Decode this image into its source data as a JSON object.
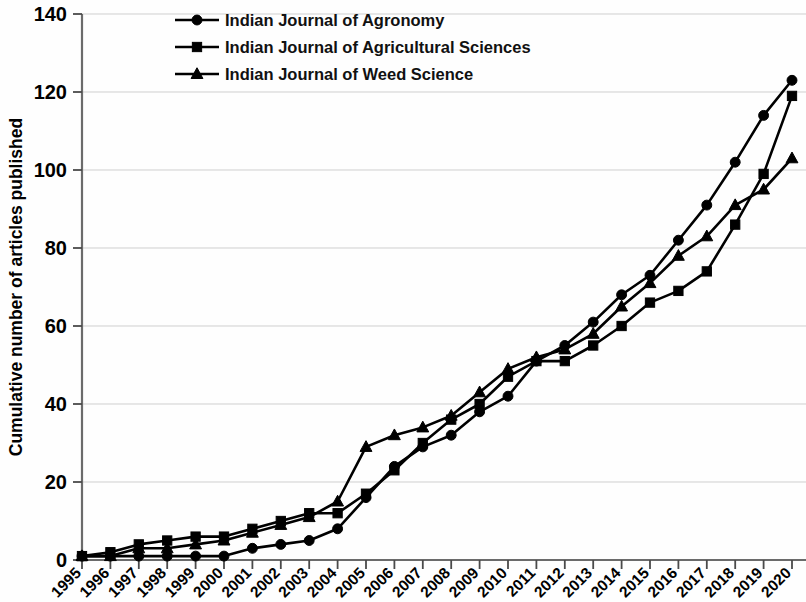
{
  "chart_data": {
    "type": "line",
    "title": "",
    "xlabel": "",
    "ylabel": "Cumulative number of articles published",
    "ylim": [
      0,
      140
    ],
    "yticks": [
      0,
      20,
      40,
      60,
      80,
      100,
      120,
      140
    ],
    "grid": true,
    "legend_position": "top-left",
    "categories": [
      "1995",
      "1996",
      "1997",
      "1998",
      "1999",
      "2000",
      "2001",
      "2002",
      "2003",
      "2004",
      "2005",
      "2006",
      "2007",
      "2008",
      "2009",
      "2010",
      "2011",
      "2012",
      "2013",
      "2014",
      "2015",
      "2016",
      "2017",
      "2018",
      "2019",
      "2020"
    ],
    "series": [
      {
        "name": "Indian Journal of Agronomy",
        "marker": "circle",
        "values": [
          1,
          1,
          1,
          1,
          1,
          1,
          3,
          4,
          5,
          8,
          16,
          24,
          29,
          32,
          38,
          42,
          51,
          55,
          61,
          68,
          73,
          82,
          91,
          102,
          114,
          123
        ]
      },
      {
        "name": "Indian Journal of Agricultural Sciences",
        "marker": "square",
        "values": [
          1,
          2,
          4,
          5,
          6,
          6,
          8,
          10,
          12,
          12,
          17,
          23,
          30,
          36,
          40,
          47,
          51,
          51,
          55,
          60,
          66,
          69,
          74,
          86,
          99,
          119
        ]
      },
      {
        "name": "Indian Journal of Weed Science",
        "marker": "triangle",
        "values": [
          1,
          1,
          3,
          3,
          4,
          5,
          7,
          9,
          11,
          15,
          29,
          32,
          34,
          37,
          43,
          49,
          52,
          54,
          58,
          65,
          71,
          78,
          83,
          91,
          95,
          103
        ]
      }
    ],
    "colors": {
      "line": "#000000",
      "grid": "#cfcfcf",
      "axis": "#6b6b6b",
      "background": "#fefefe"
    }
  },
  "axes": {
    "y_axis_title": "Cumulative number of articles published",
    "y_tick_labels": [
      "0",
      "20",
      "40",
      "60",
      "80",
      "100",
      "120",
      "140"
    ],
    "x_tick_labels": [
      "1995",
      "1996",
      "1997",
      "1998",
      "1999",
      "2000",
      "2001",
      "2002",
      "2003",
      "2004",
      "2005",
      "2006",
      "2007",
      "2008",
      "2009",
      "2010",
      "2011",
      "2012",
      "2013",
      "2014",
      "2015",
      "2016",
      "2017",
      "2018",
      "2019",
      "2020"
    ]
  },
  "legend": {
    "items": [
      {
        "label": "Indian Journal of Agronomy",
        "marker": "circle"
      },
      {
        "label": "Indian Journal of Agricultural Sciences",
        "marker": "square"
      },
      {
        "label": "Indian Journal of Weed Science",
        "marker": "triangle"
      }
    ]
  }
}
